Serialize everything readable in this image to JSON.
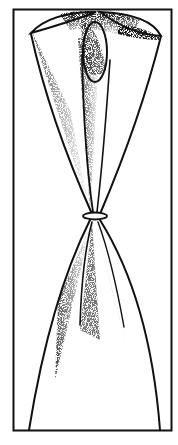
{
  "illustration": {
    "subject": "tied curtain drape with tie-back",
    "style": "stippled black-and-white line drawing",
    "colors": {
      "ink": "#111111",
      "paper": "#ffffff"
    },
    "frame": {
      "x": 13,
      "y": 9,
      "width": 159,
      "height": 422
    },
    "knot": {
      "cx": 95,
      "cy": 216
    }
  }
}
